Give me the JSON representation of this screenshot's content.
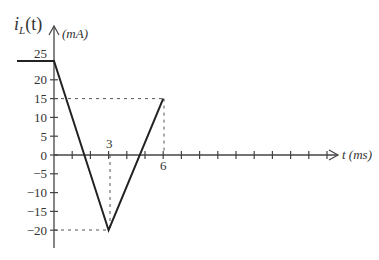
{
  "chart_data": {
    "type": "line",
    "title": "",
    "ylabel": "i_L(t)",
    "yunit": "(mA)",
    "xlabel": "t (ms)",
    "x": [
      -2,
      0,
      3,
      6
    ],
    "values": [
      25,
      25,
      -20,
      15
    ],
    "series": [
      {
        "name": "i_L(t)",
        "x": [
          -2,
          0,
          3,
          6
        ],
        "values": [
          25,
          25,
          -20,
          15
        ]
      }
    ],
    "yticks": [
      25,
      20,
      15,
      10,
      5,
      0,
      -5,
      -10,
      -15,
      -20
    ],
    "xtick_labels": [
      "3",
      "6"
    ],
    "xticks_every_ms": 1,
    "xlim": [
      0,
      16
    ],
    "ylim": [
      -25,
      28
    ],
    "annotations": [
      "dashed guide at 15 to t=6",
      "dashed guide at -20 to t=3"
    ],
    "grid": false
  },
  "labels": {
    "ylabel_main": "i",
    "ylabel_sub": "L",
    "ylabel_arg": "(t)",
    "yunit": "(mA)",
    "xlabel": "t (ms)",
    "x3": "3",
    "x6": "6"
  }
}
